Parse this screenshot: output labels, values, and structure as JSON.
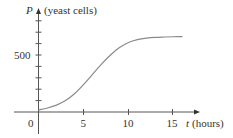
{
  "chart_data": {
    "type": "line",
    "title": "",
    "xlabel": "t (hours)",
    "ylabel": "P (yeast cells)",
    "x_var": "t",
    "x_unit": "(hours)",
    "y_var": "P",
    "y_unit": "(yeast cells)",
    "x_ticks": [
      0,
      5,
      10,
      15
    ],
    "x_tick_labels": [
      "0",
      "5",
      "10",
      "15"
    ],
    "y_ticks": [
      100,
      200,
      300,
      400,
      500,
      600,
      700,
      800
    ],
    "y_tick_labels": [
      "500"
    ],
    "xlim": [
      0,
      17
    ],
    "ylim": [
      0,
      830
    ],
    "grid": false,
    "series": [
      {
        "name": "logistic growth",
        "x": [
          0,
          1,
          2,
          3,
          4,
          5,
          6,
          7,
          8,
          9,
          10,
          11,
          12,
          13,
          14,
          15,
          16
        ],
        "values": [
          18,
          35,
          60,
          100,
          160,
          240,
          330,
          420,
          500,
          565,
          610,
          635,
          648,
          655,
          658,
          660,
          661
        ]
      }
    ],
    "colors": {
      "curve": "#8a8a8a",
      "axes": "#555555"
    }
  },
  "labels": {
    "y_axis_var": "P",
    "y_axis_unit": "(yeast cells)",
    "x_axis_var": "t",
    "x_axis_unit": "(hours)",
    "origin": "0",
    "y_tick_500": "500",
    "x_tick_5": "5",
    "x_tick_10": "10",
    "x_tick_15": "15"
  }
}
